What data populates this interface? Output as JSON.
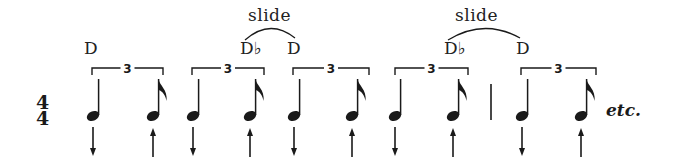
{
  "time_signature": {
    "top": "4",
    "bottom": "4"
  },
  "slide_labels": [
    {
      "text": "slide",
      "x": 248,
      "y": 5
    },
    {
      "text": "slide",
      "x": 455,
      "y": 5
    }
  ],
  "pitch_labels": [
    {
      "text": "D",
      "x": 84,
      "y": 38
    },
    {
      "text": "D♭",
      "x": 240,
      "y": 38
    },
    {
      "text": "D",
      "x": 287,
      "y": 38
    },
    {
      "text": "D♭",
      "x": 444,
      "y": 38
    },
    {
      "text": "D",
      "x": 516,
      "y": 38
    }
  ],
  "triplets": [
    {
      "label": "3",
      "x1": 92,
      "x2": 163
    },
    {
      "label": "3",
      "x1": 192,
      "x2": 264
    },
    {
      "label": "3",
      "x1": 293,
      "x2": 369
    },
    {
      "label": "3",
      "x1": 395,
      "x2": 468
    },
    {
      "label": "3",
      "x1": 521,
      "x2": 596
    }
  ],
  "notes": [
    {
      "type": "quarter",
      "x": 93,
      "stroke": "down"
    },
    {
      "type": "eighth",
      "x": 153,
      "stroke": "up"
    },
    {
      "type": "quarter",
      "x": 193,
      "stroke": "down"
    },
    {
      "type": "eighth",
      "x": 250,
      "stroke": "up"
    },
    {
      "type": "quarter",
      "x": 294,
      "stroke": "down"
    },
    {
      "type": "eighth",
      "x": 352,
      "stroke": "up"
    },
    {
      "type": "quarter",
      "x": 395,
      "stroke": "down"
    },
    {
      "type": "eighth",
      "x": 453,
      "stroke": "up"
    },
    {
      "type": "quarter",
      "x": 522,
      "stroke": "down"
    },
    {
      "type": "eighth",
      "x": 581,
      "stroke": "up"
    }
  ],
  "barline_x": 491,
  "slide_arcs": [
    {
      "x1": 245,
      "x2": 295
    },
    {
      "x1": 448,
      "x2": 520
    }
  ],
  "trailing_text": "etc."
}
